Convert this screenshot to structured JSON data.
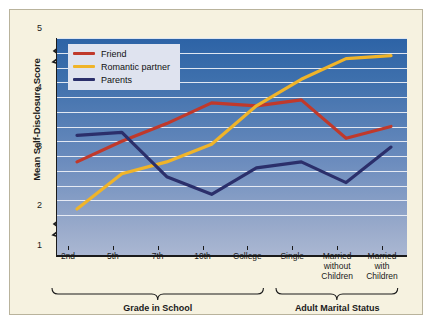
{
  "chart_data": {
    "type": "line",
    "title": "",
    "xlabel": "",
    "ylabel": "Mean Self-Disclosure Score",
    "ylim": [
      1,
      5
    ],
    "yticks": [
      1,
      2,
      3,
      4,
      5
    ],
    "y_axis_break": true,
    "grid": true,
    "legend_position": "top-left",
    "categories": [
      "2nd",
      "5th",
      "7th",
      "10th",
      "College",
      "Single",
      "Married without Children",
      "Married with Children"
    ],
    "series": [
      {
        "name": "Friend",
        "color": "#c0392b",
        "values": [
          2.9,
          3.25,
          3.55,
          3.9,
          3.85,
          3.95,
          3.3,
          3.5
        ]
      },
      {
        "name": "Romantic partner",
        "color": "#f0b429",
        "values": [
          2.1,
          2.7,
          2.9,
          3.2,
          3.85,
          4.3,
          4.65,
          4.7
        ]
      },
      {
        "name": "Parents",
        "color": "#2b2f6b",
        "values": [
          3.35,
          3.4,
          2.65,
          2.35,
          2.8,
          2.9,
          2.55,
          3.15
        ]
      }
    ],
    "groups": [
      {
        "label": "Grade in School",
        "from_category": "2nd",
        "to_category": "College"
      },
      {
        "label": "Adult Marital Status",
        "from_category": "Single",
        "to_category": "Married with Children"
      }
    ]
  }
}
